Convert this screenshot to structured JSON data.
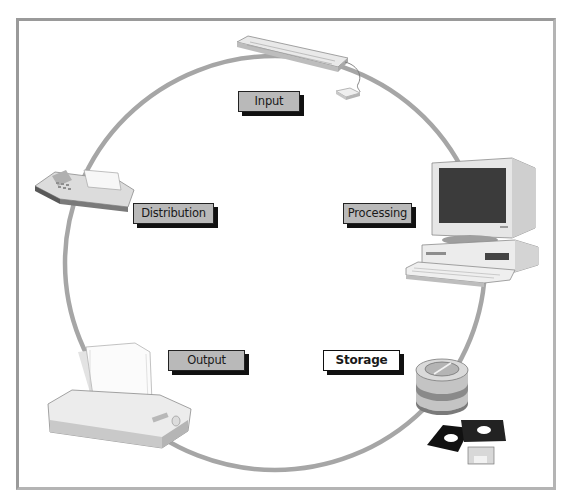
{
  "diagram": {
    "type": "cycle",
    "ring_color": "#a6a6a6",
    "label_fill": "#b9b9b9",
    "highlight_fill": "#ffffff",
    "shadow_color": "#111111",
    "stages": [
      {
        "id": "input",
        "label": "Input",
        "device": "keyboard-and-mouse",
        "highlighted": false
      },
      {
        "id": "processing",
        "label": "Processing",
        "device": "desktop-computer",
        "highlighted": false
      },
      {
        "id": "storage",
        "label": "Storage",
        "device": "disk-drive-and-floppy-disks",
        "highlighted": true
      },
      {
        "id": "output",
        "label": "Output",
        "device": "printer",
        "highlighted": false
      },
      {
        "id": "distribution",
        "label": "Distribution",
        "device": "fax-machine",
        "highlighted": false
      }
    ]
  }
}
